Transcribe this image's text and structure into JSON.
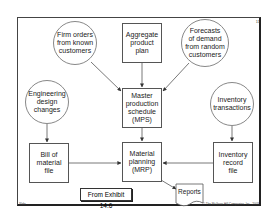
{
  "diagram": {
    "page_number": "11",
    "nodes": {
      "firm_orders": "Firm orders\nfrom known\ncustomers",
      "aggregate_plan": "Aggregate\nproduct\nplan",
      "forecasts": "Forecasts\nof demand\nfrom random\ncustomers",
      "engineering_changes": "Engineering\ndesign\nchanges",
      "mps": "Master\nproduction\nschedule\n(MPS)",
      "inventory_transactions": "Inventory\ntransactions",
      "bom": "Bill of\nmaterial\nfile",
      "mrp": "Material\nplanning\n(MRP)",
      "inventory_record": "Inventory\nrecord\nfile",
      "reports": "Reports"
    },
    "exhibit_label": "From Exhibit 14.6",
    "footer_left": "Slide",
    "footer_right": "© The McGraw-Hill Companies, Inc., 2003"
  }
}
